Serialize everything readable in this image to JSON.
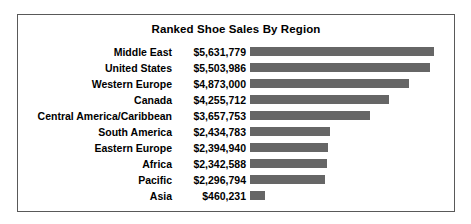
{
  "chart_data": {
    "type": "bar",
    "title": "Ranked Shoe Sales By Region",
    "orientation": "horizontal",
    "xlabel": "",
    "ylabel": "",
    "grid": false,
    "legend": "none",
    "value_prefix": "$",
    "bar_color": "#666666",
    "border_color": "#595959",
    "background_color": "#ffffff",
    "axis_max": 5631779,
    "categories": [
      "Middle East",
      "United States",
      "Western Europe",
      "Canada",
      "Central America/Caribbean",
      "South America",
      "Eastern Europe",
      "Africa",
      "Pacific",
      "Asia"
    ],
    "values": [
      5631779,
      5503986,
      4873000,
      4255712,
      3657753,
      2434783,
      2394940,
      2342588,
      2296794,
      460231
    ],
    "value_labels": [
      "$5,631,779",
      "$5,503,986",
      "$4,873,000",
      "$4,255,712",
      "$3,657,753",
      "$2,434,783",
      "$2,394,940",
      "$2,342,588",
      "$2,296,794",
      "$460,231"
    ]
  }
}
